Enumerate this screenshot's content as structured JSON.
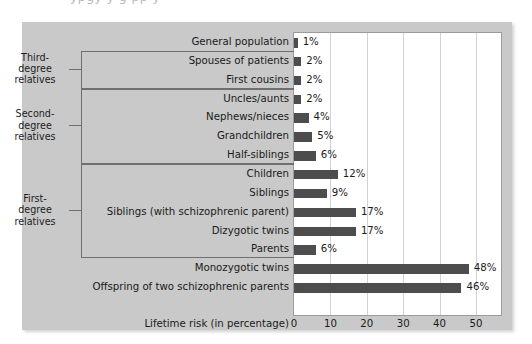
{
  "bleed": {
    "text": "partially cropped caption line above figure"
  },
  "chart_data": {
    "type": "bar",
    "orientation": "horizontal",
    "title": "",
    "xlabel": "Lifetime risk (in percentage)",
    "ylabel": "",
    "xlim": [
      0,
      55
    ],
    "xticks": [
      0,
      10,
      20,
      30,
      40,
      50
    ],
    "xtick_labels": [
      "0",
      "10",
      "20",
      "30",
      "40",
      "50"
    ],
    "grid": "vertical",
    "legend": "none",
    "bar_color": "#4d4d4d",
    "panel_color": "#c9c9c9",
    "plot_background": "#ffffff",
    "categories": [
      "General population",
      "Spouses of patients",
      "First cousins",
      "Uncles/aunts",
      "Nephews/nieces",
      "Grandchildren",
      "Half-siblings",
      "Children",
      "Siblings",
      "Siblings (with schizophrenic parent)",
      "Dizygotic twins",
      "Parents",
      "Monozygotic twins",
      "Offspring of two schizophrenic parents"
    ],
    "values": [
      1,
      2,
      2,
      2,
      4,
      5,
      6,
      12,
      9,
      17,
      17,
      6,
      48,
      46
    ],
    "value_labels": [
      "1%",
      "2%",
      "2%",
      "2%",
      "4%",
      "5%",
      "6%",
      "12%",
      "9%",
      "17%",
      "17%",
      "6%",
      "48%",
      "46%"
    ],
    "groups": [
      {
        "label_lines": [
          "Third-",
          "degree",
          "relatives"
        ],
        "first_index": 1,
        "last_index": 2
      },
      {
        "label_lines": [
          "Second-",
          "degree",
          "relatives"
        ],
        "first_index": 3,
        "last_index": 6
      },
      {
        "label_lines": [
          "First-",
          "degree",
          "relatives"
        ],
        "first_index": 7,
        "last_index": 11
      }
    ]
  }
}
